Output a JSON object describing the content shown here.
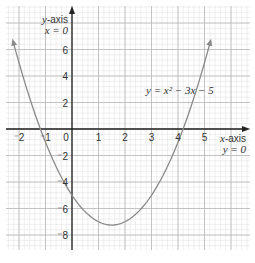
{
  "chart_data": {
    "type": "line",
    "title": "",
    "equation_label": "y = x² − 3x − 5",
    "function": "x^2 - 3x - 5",
    "xlabel": "x-axis",
    "xlabel_sub": "y = 0",
    "ylabel": "y-axis",
    "ylabel_sub": "x = 0",
    "xlim": [
      -2.5,
      6.7
    ],
    "ylim": [
      -9,
      9.5
    ],
    "grid": true,
    "x_ticks": [
      -2,
      -1,
      0,
      1,
      2,
      3,
      4,
      5
    ],
    "x_tick_labels": [
      "-2",
      "-1",
      "0",
      "1",
      "2",
      "3",
      "4",
      "5"
    ],
    "y_ticks": [
      6,
      4,
      2,
      -2,
      -4,
      -6,
      -8
    ],
    "y_tick_labels": [
      "6",
      "4",
      "2",
      "-2",
      "-4",
      "-6",
      "-8"
    ],
    "series": [
      {
        "name": "y = x^2 - 3x - 5",
        "x": [
          -2.2,
          -2,
          -1.5,
          -1,
          -0.5,
          0,
          0.5,
          1,
          1.5,
          2,
          2.5,
          3,
          3.5,
          4,
          4.5,
          5,
          5.2
        ],
        "y": [
          6.44,
          5,
          1.75,
          -1,
          -3.25,
          -5,
          -6.25,
          -7,
          -7.25,
          -7,
          -6.25,
          -5,
          -3.25,
          -1,
          1.75,
          5,
          6.44
        ]
      }
    ],
    "vertex": [
      1.5,
      -7.25
    ],
    "roots_approx": [
      -1.19,
      4.19
    ],
    "colors": {
      "curve": "#8a8a8a",
      "axis": "#222222",
      "grid_major": "#b8b8b8",
      "grid_minor": "#dedede"
    }
  }
}
